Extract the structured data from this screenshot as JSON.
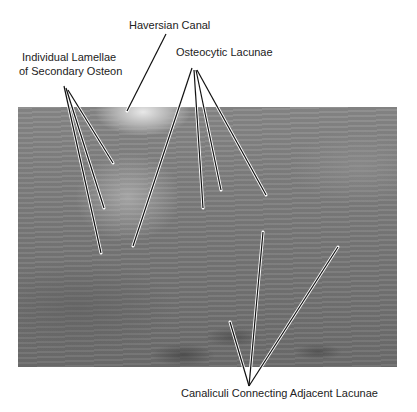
{
  "figure": {
    "type": "annotated-micrograph",
    "labels": {
      "haversian_canal": "Haversian Canal",
      "lamellae_line1": "Individual Lamellae",
      "lamellae_line2": "of Secondary Osteon",
      "osteocytic_lacunae": "Osteocytic Lacunae",
      "canaliculi": "Canaliculi Connecting Adjacent Lacunae"
    },
    "colors": {
      "label_text": "#222222",
      "leader_line": "#111111",
      "leader_halo": "#ffffff"
    }
  }
}
